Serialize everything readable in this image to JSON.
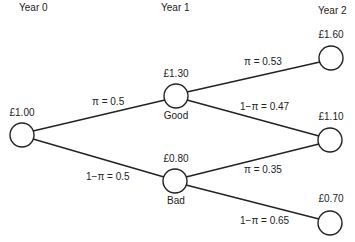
{
  "years": [
    {
      "label": "Year 0",
      "x": 20,
      "y": 2
    },
    {
      "label": "Year 1",
      "x": 162,
      "y": 2
    },
    {
      "label": "Year 2",
      "x": 318,
      "y": 5
    }
  ],
  "nodes": [
    {
      "id": "root",
      "value": "£1.00",
      "cx": 22,
      "cy": 135,
      "r": 12
    },
    {
      "id": "good",
      "value": "£1.30",
      "state": "Good",
      "cx": 176,
      "cy": 96,
      "r": 12
    },
    {
      "id": "bad",
      "value": "£0.80",
      "state": "Bad",
      "cx": 175,
      "cy": 181,
      "r": 12
    },
    {
      "id": "gg",
      "value": "£1.60",
      "cx": 331,
      "cy": 58,
      "r": 12
    },
    {
      "id": "mid",
      "value": "£1.10",
      "cx": 330,
      "cy": 140,
      "r": 12
    },
    {
      "id": "bb",
      "value": "£0.70",
      "cx": 330,
      "cy": 223,
      "r": 12
    }
  ],
  "edges": [
    {
      "from": "root",
      "to": "good",
      "label": "π = 0.5"
    },
    {
      "from": "root",
      "to": "bad",
      "label": "1−π = 0.5"
    },
    {
      "from": "good",
      "to": "gg",
      "label": "π = 0.53"
    },
    {
      "from": "good",
      "to": "mid",
      "label": "1−π = 0.47"
    },
    {
      "from": "bad",
      "to": "mid",
      "label": "π = 0.35"
    },
    {
      "from": "bad",
      "to": "bb",
      "label": "1−π = 0.65"
    }
  ],
  "colors": {
    "line": "#222222",
    "node_fill": "#ffffff"
  }
}
